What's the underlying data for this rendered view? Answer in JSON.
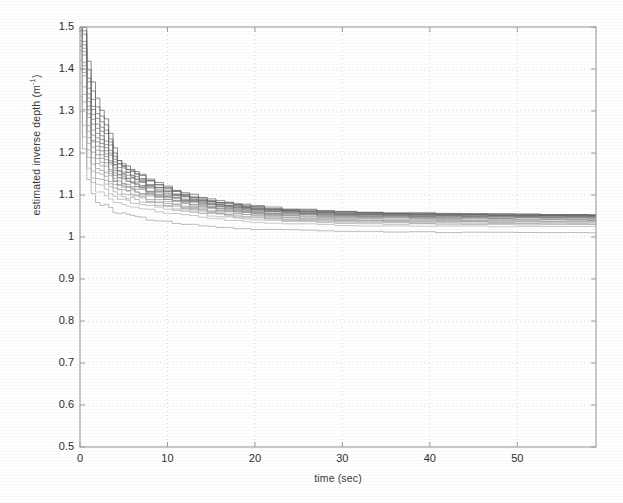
{
  "chart_data": {
    "type": "line",
    "title": "",
    "xlabel": "time (sec)",
    "ylabel": "estimated inverse depth (m⁻¹)",
    "ylabel_text": "estimated inverse depth (m",
    "ylabel_exponent": "-1",
    "ylabel_close": ")",
    "xlim": [
      0,
      59
    ],
    "ylim": [
      0.5,
      1.5
    ],
    "grid": true,
    "grid_style": "dotted",
    "legend": "none",
    "xticks": [
      0,
      10,
      20,
      30,
      40,
      50
    ],
    "xtick_labels": [
      "0",
      "10",
      "20",
      "30",
      "40",
      "50"
    ],
    "yticks": [
      0.5,
      0.6,
      0.7,
      0.8,
      0.9,
      1.0,
      1.1,
      1.2,
      1.3,
      1.4,
      1.5
    ],
    "ytick_labels": [
      "0.5",
      "0.6",
      "0.7",
      "0.8",
      "0.9",
      "1",
      "1.1",
      "1.2",
      "1.3",
      "1.4",
      "1.5"
    ],
    "series_count": 20,
    "x": [
      0,
      0.5,
      1,
      1.5,
      2,
      2.5,
      3,
      3.5,
      4,
      4.5,
      5,
      5.5,
      6,
      6.5,
      7,
      8,
      9,
      10,
      11,
      12,
      13,
      14,
      15,
      16,
      17,
      18,
      19,
      20,
      22,
      24,
      26,
      28,
      30,
      33,
      36,
      39,
      42,
      45,
      48,
      51,
      54,
      57,
      59
    ],
    "series": [
      {
        "name": "run-1",
        "color": "#555555",
        "values": [
          1.62,
          1.5,
          1.42,
          1.37,
          1.33,
          1.3,
          1.28,
          1.25,
          1.21,
          1.185,
          1.175,
          1.168,
          1.162,
          1.155,
          1.148,
          1.138,
          1.13,
          1.122,
          1.113,
          1.106,
          1.1,
          1.095,
          1.09,
          1.086,
          1.083,
          1.08,
          1.077,
          1.074,
          1.07,
          1.067,
          1.065,
          1.063,
          1.061,
          1.059,
          1.058,
          1.057,
          1.056,
          1.055,
          1.055,
          1.054,
          1.054,
          1.053,
          1.053
        ]
      },
      {
        "name": "run-2",
        "color": "#5a5a5a",
        "values": [
          1.6,
          1.49,
          1.4,
          1.35,
          1.31,
          1.285,
          1.265,
          1.235,
          1.2,
          1.18,
          1.17,
          1.163,
          1.157,
          1.15,
          1.144,
          1.134,
          1.126,
          1.118,
          1.11,
          1.103,
          1.097,
          1.092,
          1.088,
          1.084,
          1.081,
          1.078,
          1.075,
          1.072,
          1.068,
          1.066,
          1.064,
          1.062,
          1.06,
          1.058,
          1.057,
          1.056,
          1.055,
          1.055,
          1.054,
          1.054,
          1.053,
          1.053,
          1.052
        ]
      },
      {
        "name": "run-3",
        "color": "#606060",
        "values": [
          1.58,
          1.48,
          1.38,
          1.33,
          1.295,
          1.272,
          1.252,
          1.225,
          1.193,
          1.176,
          1.166,
          1.159,
          1.153,
          1.147,
          1.141,
          1.131,
          1.123,
          1.115,
          1.107,
          1.101,
          1.095,
          1.09,
          1.086,
          1.082,
          1.079,
          1.076,
          1.073,
          1.07,
          1.067,
          1.064,
          1.062,
          1.06,
          1.059,
          1.057,
          1.056,
          1.055,
          1.054,
          1.054,
          1.053,
          1.053,
          1.052,
          1.052,
          1.052
        ]
      },
      {
        "name": "run-4",
        "color": "#646464",
        "values": [
          1.56,
          1.47,
          1.37,
          1.315,
          1.283,
          1.26,
          1.242,
          1.216,
          1.187,
          1.171,
          1.162,
          1.155,
          1.149,
          1.143,
          1.137,
          1.127,
          1.119,
          1.112,
          1.104,
          1.098,
          1.093,
          1.088,
          1.084,
          1.08,
          1.077,
          1.074,
          1.072,
          1.069,
          1.065,
          1.063,
          1.061,
          1.059,
          1.057,
          1.056,
          1.055,
          1.054,
          1.053,
          1.053,
          1.052,
          1.052,
          1.051,
          1.051,
          1.051
        ]
      },
      {
        "name": "run-5",
        "color": "#686868",
        "values": [
          1.55,
          1.46,
          1.355,
          1.3,
          1.27,
          1.249,
          1.232,
          1.208,
          1.181,
          1.166,
          1.157,
          1.151,
          1.145,
          1.139,
          1.133,
          1.124,
          1.116,
          1.109,
          1.102,
          1.096,
          1.091,
          1.086,
          1.082,
          1.078,
          1.075,
          1.073,
          1.07,
          1.068,
          1.064,
          1.062,
          1.06,
          1.058,
          1.056,
          1.055,
          1.054,
          1.053,
          1.052,
          1.052,
          1.051,
          1.051,
          1.051,
          1.05,
          1.05
        ]
      },
      {
        "name": "run-6",
        "color": "#6c6c6c",
        "values": [
          1.54,
          1.45,
          1.34,
          1.29,
          1.259,
          1.239,
          1.223,
          1.2,
          1.175,
          1.161,
          1.153,
          1.147,
          1.141,
          1.136,
          1.13,
          1.121,
          1.113,
          1.106,
          1.099,
          1.094,
          1.089,
          1.084,
          1.08,
          1.077,
          1.074,
          1.071,
          1.069,
          1.066,
          1.063,
          1.061,
          1.059,
          1.057,
          1.055,
          1.054,
          1.053,
          1.052,
          1.052,
          1.051,
          1.051,
          1.05,
          1.05,
          1.05,
          1.05
        ]
      },
      {
        "name": "run-7",
        "color": "#707070",
        "values": [
          1.53,
          1.44,
          1.33,
          1.28,
          1.248,
          1.229,
          1.214,
          1.192,
          1.169,
          1.156,
          1.148,
          1.142,
          1.137,
          1.132,
          1.127,
          1.118,
          1.111,
          1.104,
          1.097,
          1.092,
          1.087,
          1.082,
          1.079,
          1.075,
          1.072,
          1.07,
          1.067,
          1.065,
          1.062,
          1.059,
          1.057,
          1.056,
          1.054,
          1.053,
          1.052,
          1.051,
          1.051,
          1.05,
          1.05,
          1.05,
          1.049,
          1.049,
          1.049
        ]
      },
      {
        "name": "run-8",
        "color": "#747474",
        "values": [
          1.52,
          1.43,
          1.32,
          1.268,
          1.238,
          1.22,
          1.206,
          1.185,
          1.163,
          1.151,
          1.144,
          1.138,
          1.133,
          1.128,
          1.124,
          1.115,
          1.108,
          1.101,
          1.095,
          1.089,
          1.085,
          1.081,
          1.077,
          1.074,
          1.071,
          1.068,
          1.066,
          1.064,
          1.06,
          1.058,
          1.056,
          1.055,
          1.053,
          1.052,
          1.051,
          1.05,
          1.05,
          1.049,
          1.049,
          1.049,
          1.048,
          1.048,
          1.048
        ]
      },
      {
        "name": "run-9",
        "color": "#787878",
        "values": [
          1.51,
          1.42,
          1.31,
          1.256,
          1.228,
          1.211,
          1.198,
          1.178,
          1.158,
          1.146,
          1.139,
          1.134,
          1.129,
          1.125,
          1.12,
          1.112,
          1.105,
          1.099,
          1.093,
          1.087,
          1.083,
          1.079,
          1.075,
          1.072,
          1.069,
          1.067,
          1.065,
          1.062,
          1.059,
          1.057,
          1.055,
          1.053,
          1.052,
          1.051,
          1.05,
          1.049,
          1.049,
          1.048,
          1.048,
          1.048,
          1.047,
          1.047,
          1.047
        ]
      },
      {
        "name": "run-10",
        "color": "#7c7c7c",
        "values": [
          1.5,
          1.41,
          1.3,
          1.245,
          1.218,
          1.202,
          1.19,
          1.171,
          1.153,
          1.142,
          1.135,
          1.13,
          1.126,
          1.121,
          1.117,
          1.109,
          1.102,
          1.096,
          1.09,
          1.085,
          1.081,
          1.077,
          1.073,
          1.07,
          1.067,
          1.065,
          1.063,
          1.06,
          1.057,
          1.055,
          1.053,
          1.052,
          1.051,
          1.049,
          1.048,
          1.048,
          1.047,
          1.047,
          1.046,
          1.046,
          1.046,
          1.046,
          1.046
        ]
      },
      {
        "name": "run-11",
        "color": "#828282",
        "values": [
          1.49,
          1.4,
          1.29,
          1.234,
          1.208,
          1.193,
          1.182,
          1.164,
          1.148,
          1.138,
          1.131,
          1.126,
          1.122,
          1.118,
          1.114,
          1.106,
          1.1,
          1.094,
          1.088,
          1.083,
          1.079,
          1.075,
          1.071,
          1.068,
          1.066,
          1.063,
          1.061,
          1.059,
          1.056,
          1.053,
          1.052,
          1.05,
          1.049,
          1.048,
          1.047,
          1.046,
          1.046,
          1.045,
          1.045,
          1.045,
          1.045,
          1.044,
          1.044
        ]
      },
      {
        "name": "run-12",
        "color": "#868686",
        "values": [
          1.48,
          1.39,
          1.28,
          1.223,
          1.198,
          1.184,
          1.174,
          1.157,
          1.142,
          1.133,
          1.127,
          1.122,
          1.118,
          1.114,
          1.11,
          1.103,
          1.097,
          1.091,
          1.086,
          1.081,
          1.077,
          1.073,
          1.069,
          1.066,
          1.064,
          1.061,
          1.059,
          1.057,
          1.054,
          1.052,
          1.05,
          1.048,
          1.047,
          1.046,
          1.045,
          1.044,
          1.044,
          1.043,
          1.043,
          1.043,
          1.043,
          1.042,
          1.042
        ]
      },
      {
        "name": "run-13",
        "color": "#8a8a8a",
        "values": [
          1.47,
          1.38,
          1.27,
          1.212,
          1.188,
          1.175,
          1.166,
          1.15,
          1.137,
          1.128,
          1.122,
          1.118,
          1.114,
          1.11,
          1.106,
          1.099,
          1.093,
          1.088,
          1.083,
          1.078,
          1.074,
          1.07,
          1.067,
          1.064,
          1.061,
          1.059,
          1.057,
          1.055,
          1.052,
          1.05,
          1.048,
          1.046,
          1.045,
          1.044,
          1.043,
          1.042,
          1.042,
          1.041,
          1.041,
          1.041,
          1.041,
          1.04,
          1.04
        ]
      },
      {
        "name": "run-14",
        "color": "#8f8f8f",
        "values": [
          1.46,
          1.36,
          1.255,
          1.2,
          1.177,
          1.165,
          1.157,
          1.142,
          1.13,
          1.122,
          1.117,
          1.113,
          1.109,
          1.105,
          1.102,
          1.095,
          1.089,
          1.084,
          1.079,
          1.075,
          1.071,
          1.067,
          1.064,
          1.061,
          1.059,
          1.056,
          1.054,
          1.052,
          1.049,
          1.047,
          1.045,
          1.044,
          1.042,
          1.041,
          1.04,
          1.04,
          1.039,
          1.039,
          1.039,
          1.038,
          1.038,
          1.038,
          1.038
        ]
      },
      {
        "name": "run-15",
        "color": "#949494",
        "values": [
          1.45,
          1.34,
          1.24,
          1.188,
          1.166,
          1.155,
          1.147,
          1.134,
          1.123,
          1.116,
          1.111,
          1.107,
          1.104,
          1.1,
          1.097,
          1.091,
          1.085,
          1.08,
          1.076,
          1.071,
          1.068,
          1.064,
          1.061,
          1.058,
          1.056,
          1.054,
          1.052,
          1.05,
          1.047,
          1.045,
          1.043,
          1.042,
          1.04,
          1.039,
          1.038,
          1.038,
          1.037,
          1.037,
          1.037,
          1.036,
          1.036,
          1.036,
          1.036
        ]
      },
      {
        "name": "run-16",
        "color": "#9a9a9a",
        "values": [
          1.44,
          1.32,
          1.225,
          1.175,
          1.155,
          1.145,
          1.137,
          1.126,
          1.116,
          1.11,
          1.105,
          1.101,
          1.098,
          1.095,
          1.092,
          1.086,
          1.081,
          1.076,
          1.072,
          1.068,
          1.065,
          1.061,
          1.058,
          1.056,
          1.053,
          1.051,
          1.049,
          1.047,
          1.044,
          1.042,
          1.041,
          1.039,
          1.038,
          1.037,
          1.036,
          1.035,
          1.035,
          1.035,
          1.034,
          1.034,
          1.034,
          1.034,
          1.034
        ]
      },
      {
        "name": "run-17",
        "color": "#a0a0a0",
        "values": [
          1.42,
          1.3,
          1.21,
          1.16,
          1.142,
          1.133,
          1.126,
          1.116,
          1.108,
          1.102,
          1.098,
          1.095,
          1.092,
          1.089,
          1.086,
          1.081,
          1.076,
          1.072,
          1.068,
          1.064,
          1.061,
          1.058,
          1.055,
          1.053,
          1.05,
          1.048,
          1.046,
          1.045,
          1.042,
          1.04,
          1.038,
          1.037,
          1.036,
          1.035,
          1.034,
          1.033,
          1.033,
          1.032,
          1.032,
          1.032,
          1.032,
          1.031,
          1.031
        ]
      },
      {
        "name": "run-18",
        "color": "#a8a8a8",
        "values": [
          1.4,
          1.27,
          1.19,
          1.145,
          1.128,
          1.12,
          1.114,
          1.105,
          1.098,
          1.093,
          1.09,
          1.087,
          1.084,
          1.082,
          1.079,
          1.074,
          1.07,
          1.066,
          1.063,
          1.06,
          1.057,
          1.054,
          1.051,
          1.049,
          1.047,
          1.045,
          1.043,
          1.042,
          1.039,
          1.037,
          1.036,
          1.034,
          1.033,
          1.032,
          1.031,
          1.031,
          1.03,
          1.03,
          1.03,
          1.029,
          1.029,
          1.029,
          1.029
        ]
      },
      {
        "name": "run-19",
        "color": "#b0b0b0",
        "values": [
          1.37,
          1.24,
          1.165,
          1.125,
          1.11,
          1.103,
          1.098,
          1.09,
          1.084,
          1.08,
          1.077,
          1.075,
          1.073,
          1.07,
          1.068,
          1.064,
          1.06,
          1.057,
          1.054,
          1.051,
          1.049,
          1.047,
          1.044,
          1.042,
          1.041,
          1.039,
          1.037,
          1.036,
          1.034,
          1.032,
          1.031,
          1.029,
          1.028,
          1.027,
          1.027,
          1.026,
          1.026,
          1.026,
          1.025,
          1.025,
          1.025,
          1.025,
          1.025
        ]
      },
      {
        "name": "run-20",
        "color": "#9e9e9e",
        "values": [
          1.34,
          1.21,
          1.138,
          1.1,
          1.086,
          1.08,
          1.075,
          1.068,
          1.062,
          1.058,
          1.055,
          1.053,
          1.051,
          1.049,
          1.047,
          1.043,
          1.04,
          1.036,
          1.033,
          1.031,
          1.029,
          1.027,
          1.025,
          1.024,
          1.022,
          1.021,
          1.02,
          1.019,
          1.018,
          1.017,
          1.016,
          1.015,
          1.014,
          1.013,
          1.012,
          1.012,
          1.011,
          1.011,
          1.011,
          1.01,
          1.01,
          1.01,
          1.01
        ]
      }
    ],
    "annotations": []
  },
  "axes": {
    "x_label": "time (sec)",
    "y_label_main": "estimated inverse depth (m",
    "y_label_sup": "-1",
    "y_label_tail": ")"
  },
  "colors": {
    "background": "#ffffff",
    "axis": "#9c9c9c",
    "grid": "#cccccc",
    "tick_text": "#2e2e2e",
    "curve_dark": "#555555",
    "curve_light": "#b0b0b0"
  }
}
